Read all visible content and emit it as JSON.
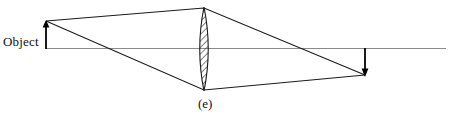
{
  "figure": {
    "caption": "(e)",
    "object_label": "Object",
    "type": "converging-lens-ray-diagram",
    "colors": {
      "ray": "#1a1a1a",
      "axis": "#8a8a8a",
      "lens_outline": "#1a1a1a",
      "lens_hatch": "#2a2a2a",
      "arrow": "#000000",
      "background": "#ffffff"
    },
    "optical_axis": {
      "y": 48.5,
      "x_start": 46,
      "x_end": 446
    },
    "lens": {
      "center_x": 204,
      "top_y": 7,
      "bottom_y": 91,
      "half_width": 8.5,
      "hatch_angle_deg": 45,
      "hatch_spacing": 3.2
    },
    "object_arrow": {
      "x": 46,
      "base_y": 49,
      "tip_y": 21,
      "direction": "up"
    },
    "image_arrow": {
      "x": 365,
      "base_y": 48,
      "tip_y": 76,
      "direction": "down"
    },
    "rays": [
      {
        "name": "upper-ray",
        "points": [
          [
            46,
            21
          ],
          [
            204,
            8
          ],
          [
            365,
            75
          ]
        ]
      },
      {
        "name": "lower-ray",
        "points": [
          [
            46,
            21
          ],
          [
            204,
            90
          ],
          [
            365,
            75
          ]
        ]
      }
    ]
  }
}
